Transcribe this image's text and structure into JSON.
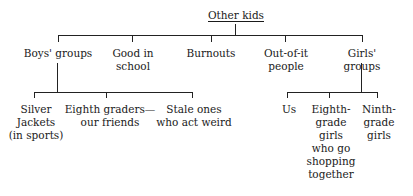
{
  "diagram": {
    "title": "Other kids",
    "type": "tree",
    "root": {
      "label": "Other kids",
      "x": 236,
      "y": 9
    },
    "level1": [
      {
        "label": "Boys' groups",
        "x": 58,
        "y": 43
      },
      {
        "label": "Good in\nschool",
        "x": 132,
        "y": 43
      },
      {
        "label": "Burnouts",
        "x": 211,
        "y": 43
      },
      {
        "label": "Out-of-it\npeople",
        "x": 285,
        "y": 43
      },
      {
        "label": "Girls' groups",
        "x": 363,
        "y": 43
      }
    ],
    "boys_children": [
      {
        "label": "Silver\nJackets\n(in sports)",
        "x": 34,
        "y": 99
      },
      {
        "label": "Eighth graders—\nour friends",
        "x": 106,
        "y": 99
      },
      {
        "label": "Stale ones\nwho act weird",
        "x": 192,
        "y": 99
      }
    ],
    "girls_children": [
      {
        "label": "Us",
        "x": 287,
        "y": 99
      },
      {
        "label": "Eighth-\ngrade\ngirls\nwho go\nshopping\ntogether",
        "x": 329,
        "y": 99
      },
      {
        "label": "Ninth-\ngrade\ngirls",
        "x": 377,
        "y": 99
      }
    ],
    "line_color": "#222222"
  }
}
